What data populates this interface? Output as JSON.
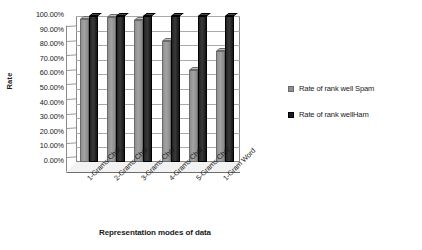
{
  "chart_data": {
    "type": "bar",
    "title": "",
    "xlabel": "Representation modes of data",
    "ylabel": "Rate",
    "categories": [
      "1-Grams Char",
      "2-Grams Char",
      "3-Grams Char",
      "4-Grams Char",
      "5-Grams Char",
      "1-Gram Word"
    ],
    "series": [
      {
        "name": "Rate of rank well Spam",
        "color": "#8e8e8e",
        "values": [
          98.0,
          99.0,
          97.0,
          83.0,
          63.0,
          76.0
        ]
      },
      {
        "name": "Rate of rank wellHam",
        "color": "#1c1c1c",
        "values": [
          100.0,
          100.0,
          100.0,
          100.0,
          100.0,
          100.0
        ]
      }
    ],
    "ylim": [
      0,
      100
    ],
    "ytick_labels": [
      "100.00%",
      "90.00%",
      "80.00%",
      "70.00%",
      "60.00%",
      "50.00%",
      "40.00%",
      "30.00%",
      "20.00%",
      "10.00%",
      "0.00%"
    ],
    "ytick_values": [
      100,
      90,
      80,
      70,
      60,
      50,
      40,
      30,
      20,
      10,
      0
    ],
    "grid": true,
    "legend_position": "right",
    "style": "3d-column-grayscale"
  }
}
